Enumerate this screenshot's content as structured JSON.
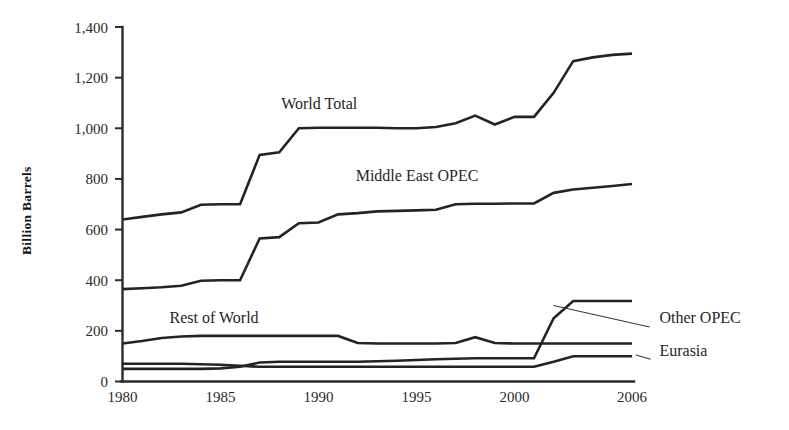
{
  "chart_data": {
    "type": "line",
    "title": "",
    "xlabel": "",
    "ylabel": "Billion Barrels",
    "xlim": [
      1980,
      2006
    ],
    "ylim": [
      0,
      1400
    ],
    "grid": false,
    "legend_position": "inline-annotations",
    "x": [
      1980,
      1981,
      1982,
      1983,
      1984,
      1985,
      1986,
      1987,
      1988,
      1989,
      1990,
      1991,
      1992,
      1993,
      1994,
      1995,
      1996,
      1997,
      1998,
      1999,
      2000,
      2001,
      2002,
      2003,
      2004,
      2005,
      2006
    ],
    "xtick_labels": [
      "1980",
      "1985",
      "1990",
      "1995",
      "2000",
      "2006"
    ],
    "xtick_values": [
      1980,
      1985,
      1990,
      1995,
      2000,
      2006
    ],
    "ytick_labels": [
      "0",
      "200",
      "400",
      "600",
      "800",
      "1,000",
      "1,200",
      "1,400"
    ],
    "ytick_values": [
      0,
      200,
      400,
      600,
      800,
      1000,
      1200,
      1400
    ],
    "series": [
      {
        "name": "World Total",
        "label": "World Total",
        "label_x": 1988.1,
        "label_y": 1075,
        "values": [
          640,
          650,
          660,
          668,
          698,
          700,
          700,
          895,
          905,
          1000,
          1002,
          1002,
          1002,
          1002,
          1000,
          1000,
          1005,
          1020,
          1050,
          1015,
          1045,
          1045,
          1140,
          1265,
          1280,
          1290,
          1295
        ]
      },
      {
        "name": "Middle East OPEC",
        "label": "Middle East OPEC",
        "label_x": 1991.9,
        "label_y": 790,
        "values": [
          365,
          368,
          372,
          378,
          398,
          400,
          400,
          565,
          570,
          625,
          628,
          660,
          665,
          672,
          674,
          676,
          678,
          700,
          702,
          702,
          703,
          703,
          745,
          758,
          765,
          772,
          780
        ]
      },
      {
        "name": "Rest of World",
        "label": "Rest of World",
        "label_x": 1982.4,
        "label_y": 232,
        "values": [
          150,
          160,
          172,
          178,
          180,
          180,
          180,
          180,
          180,
          180,
          180,
          180,
          152,
          150,
          150,
          150,
          150,
          152,
          175,
          152,
          150,
          150,
          150,
          150,
          150,
          150,
          150
        ]
      },
      {
        "name": "Other OPEC",
        "label": "Other OPEC",
        "label_x": 2007.4,
        "label_y": 232,
        "values": [
          50,
          50,
          50,
          50,
          50,
          52,
          58,
          75,
          78,
          78,
          78,
          78,
          78,
          80,
          82,
          85,
          88,
          90,
          92,
          92,
          92,
          92,
          250,
          318,
          318,
          318,
          318
        ]
      },
      {
        "name": "Eurasia",
        "label": "Eurasia",
        "label_x": 2007.4,
        "label_y": 100,
        "values": [
          70,
          70,
          70,
          70,
          68,
          66,
          62,
          58,
          58,
          58,
          58,
          58,
          58,
          58,
          58,
          58,
          58,
          58,
          58,
          58,
          58,
          58,
          78,
          100,
          100,
          100,
          100
        ]
      }
    ],
    "annotations": [
      {
        "name": "other-opec-leader",
        "from": [
          2002.0,
          300
        ],
        "to": [
          2006.9,
          215
        ]
      },
      {
        "name": "eurasia-leader",
        "from": [
          2006.2,
          105
        ],
        "to": [
          2006.95,
          88
        ]
      }
    ]
  }
}
